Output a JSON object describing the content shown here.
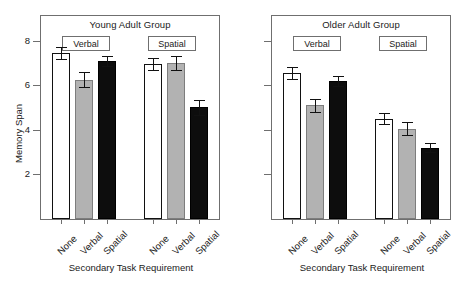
{
  "chart_data": {
    "type": "bar",
    "title": "",
    "xlabel": "Secondary Task Requirement",
    "ylabel": "Memory Span",
    "ylim": [
      0,
      9.1
    ],
    "yticks": [
      2,
      4,
      6,
      8
    ],
    "ytick_labels": [
      "2",
      "4",
      "6",
      "8"
    ],
    "grid": false,
    "legend": "none",
    "categories": [
      "None",
      "Verbal",
      "Spatial"
    ],
    "panels": [
      {
        "name": "young",
        "title": "Young Adult Group",
        "xlabel": "Secondary Task Requirement",
        "blocks": [
          {
            "label": "Verbal",
            "bars": [
              {
                "category": "None",
                "fill": "open",
                "value": 7.45,
                "error": 0.28
              },
              {
                "category": "Verbal",
                "fill": "gray",
                "value": 6.25,
                "error": 0.33
              },
              {
                "category": "Spatial",
                "fill": "solid",
                "value": 7.1,
                "error": 0.22
              }
            ]
          },
          {
            "label": "Spatial",
            "bars": [
              {
                "category": "None",
                "fill": "open",
                "value": 6.95,
                "error": 0.28
              },
              {
                "category": "Verbal",
                "fill": "gray",
                "value": 7.0,
                "error": 0.3
              },
              {
                "category": "Spatial",
                "fill": "solid",
                "value": 5.0,
                "error": 0.33
              }
            ]
          }
        ]
      },
      {
        "name": "older",
        "title": "Older Adult Group",
        "xlabel": "Secondary Task Requirement",
        "blocks": [
          {
            "label": "Verbal",
            "bars": [
              {
                "category": "None",
                "fill": "open",
                "value": 6.55,
                "error": 0.28
              },
              {
                "category": "Verbal",
                "fill": "gray",
                "value": 5.1,
                "error": 0.3
              },
              {
                "category": "Spatial",
                "fill": "solid",
                "value": 6.2,
                "error": 0.22
              }
            ]
          },
          {
            "label": "Spatial",
            "bars": [
              {
                "category": "None",
                "fill": "open",
                "value": 4.5,
                "error": 0.25
              },
              {
                "category": "Verbal",
                "fill": "gray",
                "value": 4.05,
                "error": 0.28
              },
              {
                "category": "Spatial",
                "fill": "solid",
                "value": 3.2,
                "error": 0.2
              }
            ]
          }
        ]
      }
    ],
    "colors": {
      "open": "#ffffff",
      "gray": "#b2b2b2",
      "solid": "#0d0d0d",
      "axis": "#6f6f6f",
      "text": "#1a1a1a"
    }
  },
  "panel_left": {
    "title": "Young Adult Group",
    "cond_verbal": "Verbal",
    "cond_spatial": "Spatial",
    "xaxis_title": "Secondary Task Requirement",
    "yaxis_title": "Memory Span",
    "ytick_labels": [
      "8",
      "6",
      "4",
      "2"
    ],
    "xtick_labels": [
      "None",
      "Verbal",
      "Spatial",
      "None",
      "Verbal",
      "Spatial"
    ]
  },
  "panel_right": {
    "title": "Older Adult Group",
    "cond_verbal": "Verbal",
    "cond_spatial": "Spatial",
    "xaxis_title": "Secondary Task Requirement",
    "xtick_labels": [
      "None",
      "Verbal",
      "Spatial",
      "None",
      "Verbal",
      "Spatial"
    ]
  },
  "caption": {
    "cut_text": ""
  }
}
